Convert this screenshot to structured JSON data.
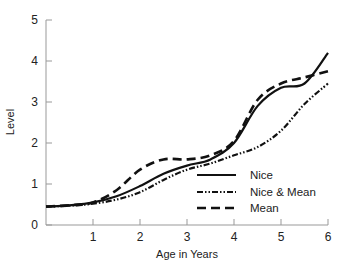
{
  "chart_data": {
    "type": "line",
    "title": "",
    "xlabel": "Age in Years",
    "ylabel": "Level",
    "xlim": [
      0,
      6
    ],
    "ylim": [
      0,
      5
    ],
    "x_ticks": [
      "1",
      "2",
      "3",
      "4",
      "5",
      "6"
    ],
    "y_ticks": [
      "0",
      "1",
      "2",
      "3",
      "4",
      "5"
    ],
    "grid": false,
    "legend_position": "lower right",
    "x": [
      0,
      0.5,
      1,
      1.5,
      2,
      2.5,
      3,
      3.5,
      4,
      4.5,
      5,
      5.5,
      6
    ],
    "series": [
      {
        "name": "Nice",
        "style": "solid",
        "values": [
          0.45,
          0.48,
          0.55,
          0.7,
          0.95,
          1.25,
          1.45,
          1.6,
          2.0,
          2.9,
          3.35,
          3.45,
          4.2
        ]
      },
      {
        "name": "Nice & Mean",
        "style": "dash-dot",
        "values": [
          0.45,
          0.47,
          0.52,
          0.62,
          0.8,
          1.1,
          1.35,
          1.5,
          1.7,
          1.9,
          2.3,
          2.95,
          3.45
        ]
      },
      {
        "name": "Mean",
        "style": "dashed",
        "values": [
          0.45,
          0.48,
          0.55,
          0.85,
          1.35,
          1.6,
          1.6,
          1.7,
          2.05,
          3.05,
          3.45,
          3.6,
          3.75
        ]
      }
    ]
  },
  "legend": {
    "items": [
      {
        "label": "Nice"
      },
      {
        "label": "Nice & Mean"
      },
      {
        "label": "Mean"
      }
    ]
  }
}
